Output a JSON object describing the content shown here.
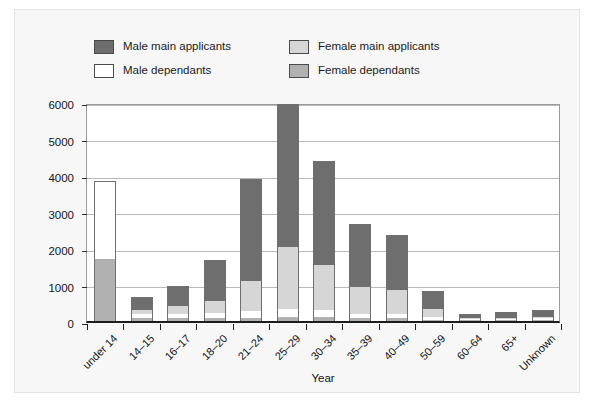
{
  "chart_data": {
    "type": "bar",
    "stacked": true,
    "title": "",
    "xlabel": "Year",
    "ylabel": "",
    "ylim": [
      0,
      6000
    ],
    "ytick_step": 1000,
    "yticks": [
      0,
      1000,
      2000,
      3000,
      4000,
      5000,
      6000
    ],
    "grid": true,
    "legend_position": "top",
    "categories": [
      "under 14",
      "14–15",
      "16–17",
      "18–20",
      "21–24",
      "25–29",
      "30–34",
      "35–39",
      "40–49",
      "50–59",
      "60–64",
      "65+",
      "Unknown"
    ],
    "series": [
      {
        "name": "Male main applicants",
        "color": "#6e6e6e",
        "values": [
          0,
          340,
          560,
          1130,
          2780,
          3910,
          2840,
          1720,
          1490,
          480,
          110,
          170,
          180
        ]
      },
      {
        "name": "Male dependants",
        "color": "#ffffff",
        "values": [
          2130,
          120,
          120,
          130,
          180,
          230,
          180,
          130,
          120,
          70,
          30,
          30,
          40
        ]
      },
      {
        "name": "Female main applicants",
        "color": "#d6d6d6",
        "values": [
          0,
          120,
          210,
          330,
          830,
          1700,
          1250,
          740,
          660,
          230,
          20,
          30,
          40
        ]
      },
      {
        "name": "Female dependants",
        "color": "#b1b1b1",
        "values": [
          1700,
          70,
          80,
          80,
          90,
          110,
          110,
          70,
          80,
          40,
          20,
          20,
          30
        ]
      }
    ],
    "totals": [
      3830,
      650,
      970,
      1670,
      3880,
      5950,
      4380,
      2660,
      2350,
      820,
      180,
      250,
      290
    ]
  },
  "legend": {
    "items": [
      {
        "label": "Male main applicants",
        "color": "#6e6e6e",
        "row": 0,
        "col": 0
      },
      {
        "label": "Female main applicants",
        "color": "#d6d6d6",
        "row": 0,
        "col": 1
      },
      {
        "label": "Male dependants",
        "color": "#ffffff",
        "row": 1,
        "col": 0
      },
      {
        "label": "Female dependants",
        "color": "#b1b1b1",
        "row": 1,
        "col": 1
      }
    ]
  }
}
